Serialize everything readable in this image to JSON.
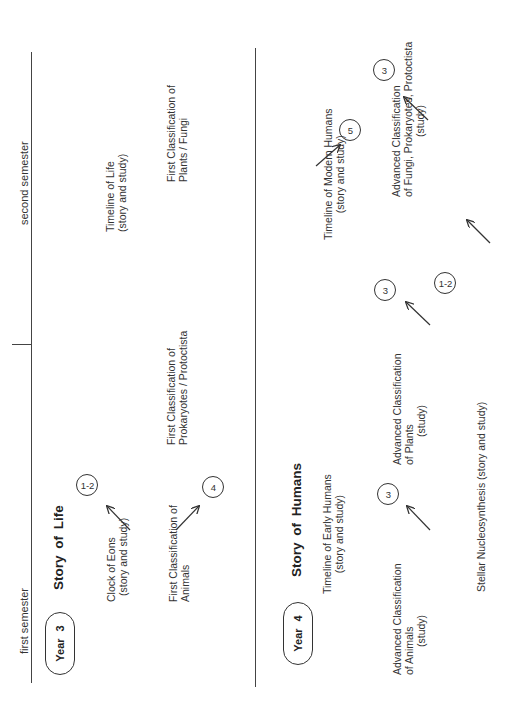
{
  "header": {
    "first_semester": "first semester",
    "second_semester": "second semester"
  },
  "year3": {
    "badge": "Year 3",
    "title": "Story of Life",
    "items": [
      {
        "line1": "Clock of Eons",
        "line2": "(story and study)",
        "circle": "1-2"
      },
      {
        "line1": "First Classification of",
        "line2": "Animals",
        "circle": "4"
      },
      {
        "line1": "Timeline of Life",
        "line2": "(story and study)"
      },
      {
        "line1": "First Classification of",
        "line2": "Prokaryotes / Protoctista"
      },
      {
        "line1": "First Classification of",
        "line2": "Plants / Fungi"
      }
    ]
  },
  "year4": {
    "badge": "Year 4",
    "title": "Story of Humans",
    "items": [
      {
        "line1": "Timeline of Early Humans",
        "line2": "(story and study)"
      },
      {
        "line1": "Advanced Classification",
        "line2": "of Animals",
        "line3": "(study)",
        "circle": "3"
      },
      {
        "line1": "Stellar Nucleosynthesis (story and study)",
        "circle": "1-2"
      },
      {
        "line1": "Advanced Classification",
        "line2": "of Plants",
        "line3": "(study)",
        "circle": "3"
      },
      {
        "line1": "Timeline of Modern Humans",
        "line2": "(story and study)",
        "circle": "5"
      },
      {
        "line1": "Advanced Classification",
        "line2": "of Fungi, Prokaryotes, Protoctista",
        "line3": "(study)",
        "circle": "3"
      }
    ]
  }
}
